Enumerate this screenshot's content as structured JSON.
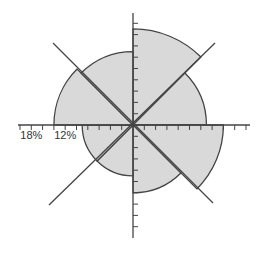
{
  "chart_data": {
    "type": "polar-area",
    "title": "",
    "center": {
      "x": 133,
      "y": 125
    },
    "px_per_percent": 5.65,
    "fill_color": "#d9d9d9",
    "stroke_color": "#444444",
    "directions": [
      "N",
      "NE",
      "E",
      "SE",
      "S",
      "SW",
      "W",
      "NW"
    ],
    "sectors": [
      {
        "from_deg": 0,
        "to_deg": 45,
        "value": 17
      },
      {
        "from_deg": 45,
        "to_deg": 90,
        "value": 13
      },
      {
        "from_deg": 90,
        "to_deg": 135,
        "value": 16
      },
      {
        "from_deg": 135,
        "to_deg": 180,
        "value": 12
      },
      {
        "from_deg": 180,
        "to_deg": 225,
        "value": 9
      },
      {
        "from_deg": 225,
        "to_deg": 270,
        "value": 9
      },
      {
        "from_deg": 270,
        "to_deg": 315,
        "value": 14
      },
      {
        "from_deg": 315,
        "to_deg": 360,
        "value": 13
      }
    ],
    "radial_axis": {
      "tick_step_percent": 2,
      "max_percent": 20
    },
    "axis_labels": [
      {
        "text": "18%",
        "value": 18
      },
      {
        "text": "12%",
        "value": 12
      }
    ],
    "grid": false,
    "legend": "none"
  }
}
